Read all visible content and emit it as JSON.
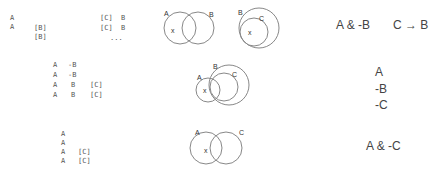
{
  "rows": [
    {
      "table": [
        [
          "A",
          "",
          "",
          ""
        ],
        [
          "A",
          "[B]",
          "[C]",
          "B"
        ],
        [
          "",
          "[B]",
          "[C]",
          "B"
        ],
        [
          "",
          "",
          "...",
          ""
        ]
      ],
      "table_row1": [
        "A"
      ],
      "table_row2": [
        "A",
        "[B]",
        "[C]",
        "B"
      ],
      "table_row3": [
        "[B]",
        "[C]",
        "B"
      ],
      "table_ellipsis": "...",
      "venn1": {
        "circles": [
          "A",
          "B"
        ],
        "point": "x"
      },
      "venn2": {
        "circles": [
          "B",
          "C"
        ],
        "point": "x"
      },
      "formulas": [
        "A & -B",
        "C → B"
      ]
    },
    {
      "table": [
        [
          "A",
          "-B",
          ""
        ],
        [
          "A",
          "-B",
          ""
        ],
        [
          "A",
          "B",
          "[C]"
        ],
        [
          "A",
          "B",
          "[C]"
        ]
      ],
      "venn": {
        "circles": [
          "A",
          "B",
          "C"
        ],
        "point": "x"
      },
      "formulas": [
        "A",
        "-B",
        "-C"
      ]
    },
    {
      "table": [
        [
          "A",
          ""
        ],
        [
          "A",
          ""
        ],
        [
          "A",
          "[C]"
        ],
        [
          "A",
          "[C]"
        ]
      ],
      "venn": {
        "circles": [
          "A",
          "C"
        ],
        "point": "x"
      },
      "formulas": [
        "A & -C"
      ]
    }
  ]
}
